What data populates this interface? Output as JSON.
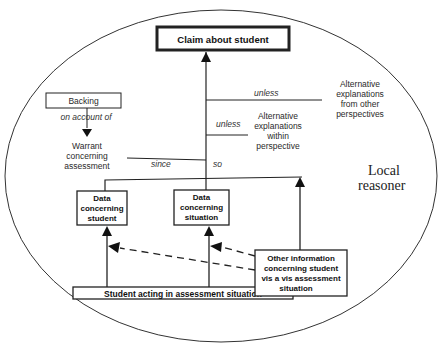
{
  "diagram": {
    "type": "toulmin-argument",
    "container_label": {
      "line1": "Local",
      "line2": "reasoner"
    },
    "claim": "Claim about student",
    "backing": "Backing",
    "on_account_of": "on account of",
    "warrant": {
      "line1": "Warrant",
      "line2": "concerning",
      "line3": "assessment"
    },
    "since": "since",
    "so": "so",
    "unless_1": "unless",
    "unless_2": "unless",
    "alt_other": {
      "line1": "Alternative",
      "line2": "explanations",
      "line3": "from other",
      "line4": "perspectives"
    },
    "alt_within": {
      "line1": "Alternative",
      "line2": "explanations",
      "line3": "within",
      "line4": "perspective"
    },
    "data_student": {
      "line1": "Data",
      "line2": "concerning",
      "line3": "student"
    },
    "data_situation": {
      "line1": "Data",
      "line2": "concerning",
      "line3": "situation"
    },
    "student_acting": "Student acting in assessment situation",
    "other_info": {
      "line1": "Other information",
      "line2": "concerning student",
      "line3": "vis a vis assessment",
      "line4": "situation"
    },
    "colors": {
      "stroke": "#222222",
      "background": "#ffffff"
    }
  }
}
